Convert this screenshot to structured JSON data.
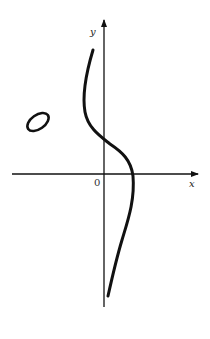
{
  "figure": {
    "axes": {
      "x_label": "x",
      "y_label": "y",
      "origin_label": "0"
    },
    "components": [
      {
        "name": "main-branch",
        "kind": "S-shaped open curve crossing the y-axis above origin and the x-axis to the right of origin"
      },
      {
        "name": "oval",
        "kind": "closed oval in second quadrant"
      }
    ],
    "colors": {
      "stroke": "#111111",
      "background": "#ffffff"
    }
  }
}
